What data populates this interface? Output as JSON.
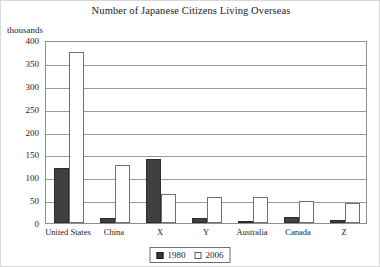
{
  "chart_data": {
    "type": "bar",
    "title": "Number of Japanese Citizens Living Overseas",
    "xlabel": "",
    "ylabel": "thousands",
    "ylim": [
      0,
      400
    ],
    "yticks": [
      0,
      50,
      100,
      150,
      200,
      250,
      300,
      350,
      400
    ],
    "ytick_labels": [
      "0",
      "50",
      "100",
      "150",
      "200",
      "250",
      "300",
      "350",
      "400"
    ],
    "grid": true,
    "legend_position": "bottom-center",
    "categories": [
      "United States",
      "China",
      "X",
      "Y",
      "Australia",
      "Canada",
      "Z"
    ],
    "series": [
      {
        "name": "1980",
        "color": "#404040",
        "values": [
          120,
          12,
          141,
          10,
          5,
          13,
          6
        ]
      },
      {
        "name": "2006",
        "color": "#ffffff",
        "values": [
          373,
          127,
          64,
          57,
          57,
          48,
          43
        ]
      }
    ]
  }
}
